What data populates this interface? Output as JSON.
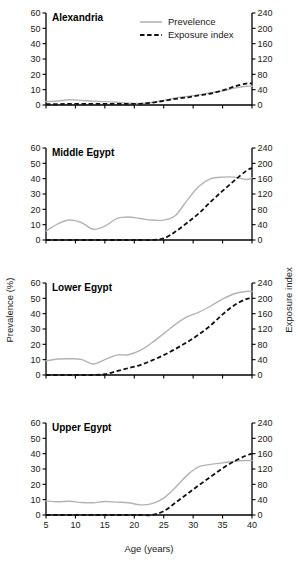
{
  "figure": {
    "xlabel": "Age (years)",
    "ylabel_left": "Prevalence (%)",
    "ylabel_right": "Exposure index",
    "legend": [
      {
        "label": "Prevelence",
        "style": "solid",
        "color": "#b3b3b3"
      },
      {
        "label": "Exposure index",
        "style": "dashed",
        "color": "#111111"
      }
    ],
    "x_ticks": [
      5,
      10,
      15,
      20,
      25,
      30,
      35,
      40
    ],
    "y_ticks_left": [
      0,
      10,
      20,
      30,
      40,
      50,
      60
    ],
    "y_ticks_right": [
      0,
      40,
      80,
      120,
      160,
      200,
      240
    ],
    "colors": {
      "prevalence": "#b3b3b3",
      "exposure": "#111111",
      "axis": "#000000",
      "background": "#ffffff"
    }
  },
  "chart_data": [
    {
      "type": "line",
      "title": "Alexandria",
      "xlabel": "Age (years)",
      "ylabel": "Prevalence (%)",
      "ylabel_right": "Exposure index",
      "xlim": [
        5,
        40
      ],
      "ylim": [
        0,
        60
      ],
      "ylim_right": [
        0,
        240
      ],
      "grid": false,
      "legend_position": "top-center-figure",
      "x": [
        5,
        7,
        9,
        11,
        13,
        15,
        17,
        19,
        21,
        23,
        25,
        27,
        29,
        31,
        33,
        35,
        37,
        39,
        40
      ],
      "series": [
        {
          "name": "Prevelence",
          "axis": "left",
          "units": "%",
          "values": [
            2.2,
            2.6,
            3.4,
            3.0,
            2.4,
            2.2,
            1.8,
            1.2,
            1.0,
            1.6,
            3.0,
            4.6,
            5.6,
            6.6,
            8.0,
            9.2,
            11.0,
            12.2,
            12.2
          ]
        },
        {
          "name": "Exposure index",
          "axis": "right",
          "units": "index",
          "values": [
            2,
            2,
            3,
            3,
            3,
            3,
            3,
            3,
            3,
            6,
            11,
            16,
            20,
            25,
            30,
            38,
            48,
            56,
            56
          ]
        }
      ]
    },
    {
      "type": "line",
      "title": "Middle Egypt",
      "xlabel": "Age (years)",
      "ylabel": "Prevalence (%)",
      "ylabel_right": "Exposure index",
      "xlim": [
        5,
        40
      ],
      "ylim": [
        0,
        60
      ],
      "ylim_right": [
        0,
        240
      ],
      "grid": false,
      "legend_position": "none",
      "x": [
        5,
        7,
        9,
        11,
        13,
        15,
        17,
        19,
        21,
        23,
        25,
        27,
        29,
        31,
        33,
        35,
        37,
        39,
        40
      ],
      "series": [
        {
          "name": "Prevelence",
          "axis": "left",
          "units": "%",
          "values": [
            5.8,
            10.5,
            13.0,
            11.4,
            7.0,
            9.0,
            14.0,
            15.0,
            14.0,
            13.0,
            13.0,
            16.0,
            26.0,
            35.0,
            40.0,
            41.0,
            41.0,
            39.5,
            40.5
          ]
        },
        {
          "name": "Exposure index",
          "axis": "right",
          "units": "index",
          "values": [
            0,
            0,
            0,
            0,
            0,
            0,
            0,
            0,
            0,
            0,
            4,
            22,
            45,
            70,
            100,
            128,
            155,
            180,
            188
          ]
        }
      ]
    },
    {
      "type": "line",
      "title": "Lower Egypt",
      "xlabel": "Age (years)",
      "ylabel": "Prevalence (%)",
      "ylabel_right": "Exposure index",
      "xlim": [
        5,
        40
      ],
      "ylim": [
        0,
        60
      ],
      "ylim_right": [
        0,
        240
      ],
      "grid": false,
      "legend_position": "none",
      "x": [
        5,
        7,
        9,
        11,
        13,
        15,
        17,
        19,
        21,
        23,
        25,
        27,
        29,
        31,
        33,
        35,
        37,
        39,
        40
      ],
      "series": [
        {
          "name": "Prevelence",
          "axis": "left",
          "units": "%",
          "values": [
            9.2,
            10.4,
            10.6,
            10.2,
            7.2,
            10.0,
            13.0,
            13.2,
            16.0,
            21.0,
            27.0,
            33.0,
            38.0,
            41.0,
            45.0,
            49.5,
            53.0,
            54.5,
            54.5
          ]
        },
        {
          "name": "Exposure index",
          "axis": "right",
          "units": "index",
          "values": [
            0,
            0,
            0,
            0,
            0,
            2,
            10,
            18,
            26,
            38,
            52,
            68,
            86,
            106,
            130,
            158,
            182,
            198,
            200
          ]
        }
      ]
    },
    {
      "type": "line",
      "title": "Upper Egypt",
      "xlabel": "Age (years)",
      "ylabel": "Prevalence (%)",
      "ylabel_right": "Exposure index",
      "xlim": [
        5,
        40
      ],
      "ylim": [
        0,
        60
      ],
      "ylim_right": [
        0,
        240
      ],
      "grid": false,
      "legend_position": "none",
      "x": [
        5,
        7,
        9,
        11,
        13,
        15,
        17,
        19,
        21,
        23,
        25,
        27,
        29,
        31,
        33,
        35,
        37,
        39,
        40
      ],
      "series": [
        {
          "name": "Prevelence",
          "axis": "left",
          "units": "%",
          "values": [
            9.2,
            8.6,
            9.0,
            8.2,
            8.0,
            8.8,
            8.4,
            8.0,
            6.6,
            7.4,
            11.0,
            18.0,
            26.0,
            31.5,
            33.0,
            34.0,
            35.0,
            35.5,
            35.5
          ]
        },
        {
          "name": "Exposure index",
          "axis": "right",
          "units": "index",
          "values": [
            0,
            0,
            0,
            0,
            0,
            0,
            0,
            0,
            0,
            0,
            10,
            32,
            55,
            78,
            100,
            122,
            140,
            155,
            160
          ]
        }
      ]
    }
  ]
}
